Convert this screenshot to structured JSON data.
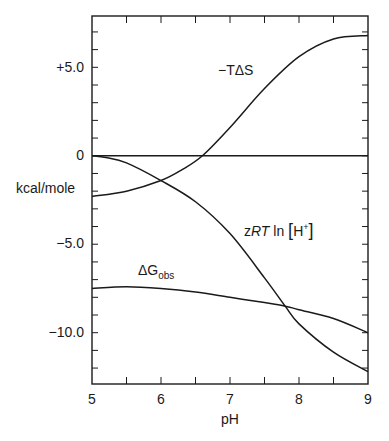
{
  "chart_data": {
    "type": "line",
    "title": "",
    "xlabel": "pH",
    "ylabel": "kcal/mole",
    "xlim": [
      5,
      9
    ],
    "ylim": [
      -12.9,
      7.9
    ],
    "xticks": [
      5,
      6,
      7,
      8,
      9
    ],
    "xtick_labels": [
      "5",
      "6",
      "7",
      "8",
      "9"
    ],
    "x_minor_step": 0.5,
    "yticks": [
      5.0,
      0,
      -5.0,
      -10.0
    ],
    "ytick_labels": [
      "+5.0",
      "0",
      "−5.0",
      "−10.0"
    ],
    "y_minor_step": 1.0,
    "grid": false,
    "legend": "inline labels",
    "reference_lines": [
      {
        "y": 0
      }
    ],
    "series": [
      {
        "name": "−TΔS",
        "x": [
          5.0,
          5.5,
          6.0,
          6.3,
          6.6,
          7.0,
          7.5,
          8.0,
          8.5,
          9.0
        ],
        "values": [
          -2.3,
          -2.0,
          -1.4,
          -0.8,
          0.0,
          1.6,
          3.8,
          5.6,
          6.6,
          6.8
        ],
        "label_pos": {
          "x": 7.05,
          "y": 5.3
        }
      },
      {
        "name": "zRT ln[H⁺]",
        "x": [
          5.0,
          5.2,
          5.5,
          6.0,
          6.5,
          7.0,
          7.5,
          7.8,
          8.0,
          8.5,
          9.0
        ],
        "values": [
          0.0,
          -0.1,
          -0.4,
          -1.4,
          -2.6,
          -4.4,
          -6.9,
          -8.5,
          -9.5,
          -11.1,
          -12.2
        ],
        "label_pos": {
          "x": 7.35,
          "y": -3.2
        }
      },
      {
        "name": "ΔG_obs",
        "x": [
          5.0,
          5.5,
          6.0,
          6.5,
          7.0,
          7.5,
          7.8,
          8.0,
          8.5,
          9.0
        ],
        "values": [
          -7.5,
          -7.4,
          -7.5,
          -7.7,
          -8.0,
          -8.3,
          -8.5,
          -8.7,
          -9.2,
          -10.0
        ],
        "label_pos": {
          "x": 5.7,
          "y": -6.6
        }
      }
    ]
  },
  "labels": {
    "ylabel": "kcal/mole",
    "xlabel": "pH",
    "series": {
      "tds_prefix": "−T",
      "tds_delta": "Δ",
      "tds_suffix": "S",
      "zrt_z": "z",
      "zrt_rt": "RT",
      "zrt_ln": " ln ",
      "zrt_open": "[",
      "zrt_h": "H",
      "zrt_sup": "+",
      "zrt_close": "]",
      "dg_main": "ΔG",
      "dg_sub": "obs"
    },
    "xticks": [
      "5",
      "6",
      "7",
      "8",
      "9"
    ],
    "yticks": [
      "+5.0",
      "0",
      "−5.0",
      "−10.0"
    ]
  }
}
